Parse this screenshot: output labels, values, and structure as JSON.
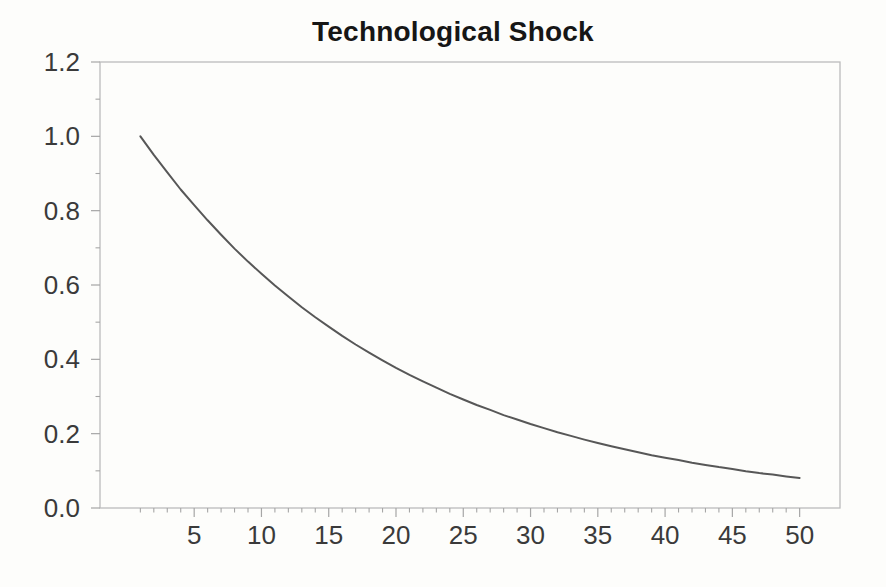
{
  "chart_data": {
    "type": "line",
    "title": "Technological Shock",
    "xlabel": "",
    "ylabel": "",
    "series_name": "technological-shock-impulse-response",
    "x": [
      1,
      2,
      3,
      4,
      5,
      6,
      7,
      8,
      9,
      10,
      11,
      12,
      13,
      14,
      15,
      16,
      17,
      18,
      19,
      20,
      21,
      22,
      23,
      24,
      25,
      26,
      27,
      28,
      29,
      30,
      31,
      32,
      33,
      34,
      35,
      36,
      37,
      38,
      39,
      40,
      41,
      42,
      43,
      44,
      45,
      46,
      47,
      48,
      49,
      50
    ],
    "values": [
      1.0,
      0.95,
      0.903,
      0.857,
      0.815,
      0.774,
      0.735,
      0.698,
      0.663,
      0.63,
      0.599,
      0.569,
      0.54,
      0.513,
      0.488,
      0.463,
      0.44,
      0.418,
      0.397,
      0.377,
      0.358,
      0.341,
      0.324,
      0.307,
      0.292,
      0.277,
      0.264,
      0.25,
      0.238,
      0.226,
      0.215,
      0.204,
      0.194,
      0.184,
      0.175,
      0.166,
      0.158,
      0.15,
      0.142,
      0.135,
      0.129,
      0.122,
      0.116,
      0.11,
      0.105,
      0.099,
      0.094,
      0.09,
      0.085,
      0.081
    ],
    "xlim": [
      -2,
      53
    ],
    "ylim": [
      0,
      1.2
    ],
    "xticks": [
      5,
      10,
      15,
      20,
      25,
      30,
      35,
      40,
      45,
      50
    ],
    "x_minor_from": 1,
    "x_minor_to": 50,
    "yticks": [
      0,
      0.2,
      0.4,
      0.6,
      0.8,
      1,
      1.2
    ],
    "ytick_labels": [
      "0.0",
      "0.2",
      "0.4",
      "0.6",
      "0.8",
      "1.0",
      "1.2"
    ],
    "y_minor_step": 0.1,
    "grid": false,
    "legend": "none",
    "line_color": "#575757",
    "axis_color": "#bcbcbc",
    "tick_color": "#a6a6a6",
    "label_color": "#3a3a3a",
    "title_color": "#161616"
  }
}
